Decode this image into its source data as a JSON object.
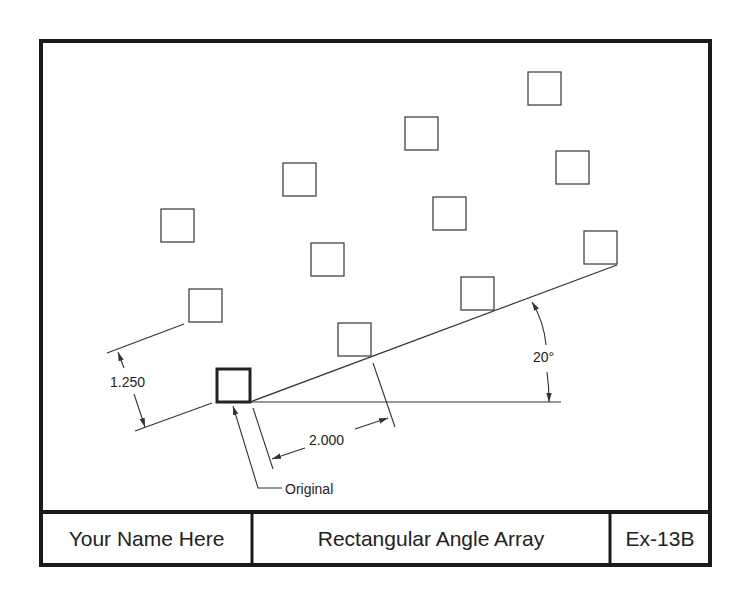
{
  "drawing": {
    "title": "Rectangular Angle Array",
    "author": "Your Name Here",
    "exercise_id": "Ex-13B",
    "frame": {
      "x": 41,
      "y": 41,
      "width": 669,
      "height": 524,
      "title_block_top": 512,
      "dividers_x": [
        252,
        610
      ]
    },
    "colors": {
      "line": "#333333",
      "frame": "#1a1a1a",
      "background": "#ffffff"
    },
    "square_size": 33,
    "original": {
      "x": 217,
      "y": 369,
      "label": "Original"
    },
    "array_squares": [
      {
        "x": 338,
        "y": 323
      },
      {
        "x": 461,
        "y": 277
      },
      {
        "x": 584,
        "y": 231
      },
      {
        "x": 189,
        "y": 289
      },
      {
        "x": 311,
        "y": 243
      },
      {
        "x": 433,
        "y": 197
      },
      {
        "x": 556,
        "y": 151
      },
      {
        "x": 161,
        "y": 209
      },
      {
        "x": 283,
        "y": 163
      },
      {
        "x": 405,
        "y": 117
      },
      {
        "x": 528,
        "y": 72
      }
    ],
    "dimensions": {
      "row_spacing": "1.250",
      "column_spacing": "2.000",
      "angle": "20°"
    }
  }
}
